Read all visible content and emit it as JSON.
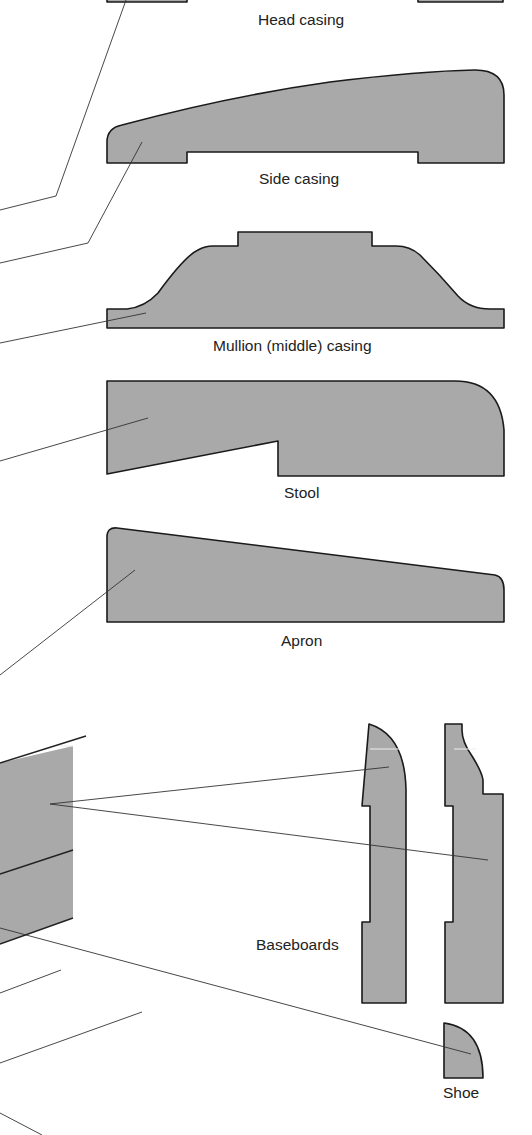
{
  "diagram": {
    "colors": {
      "profile_fill": "#a9a9a9",
      "outline": "#1a1a1a",
      "background": "#ffffff"
    },
    "labels": {
      "head_casing": "Head casing",
      "side_casing": "Side casing",
      "mullion_casing": "Mullion (middle) casing",
      "stool": "Stool",
      "apron": "Apron",
      "baseboards": "Baseboards",
      "shoe": "Shoe"
    },
    "profiles": [
      {
        "id": "head-casing",
        "label": "Head casing",
        "partially_visible": true
      },
      {
        "id": "side-casing",
        "label": "Side casing"
      },
      {
        "id": "mullion-casing",
        "label": "Mullion (middle) casing"
      },
      {
        "id": "stool",
        "label": "Stool"
      },
      {
        "id": "apron",
        "label": "Apron"
      },
      {
        "id": "baseboard-1",
        "label": "Baseboards"
      },
      {
        "id": "baseboard-2",
        "label": "Baseboards"
      },
      {
        "id": "shoe",
        "label": "Shoe"
      }
    ]
  }
}
